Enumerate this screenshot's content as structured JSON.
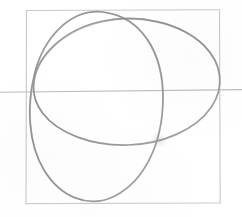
{
  "artwork": {
    "title": "pencil-sketch-overlapping-ellipses",
    "medium": "graphite pencil on white paper",
    "background_color": "#ffffff",
    "canvas": {
      "width": 242,
      "height": 217
    }
  },
  "palette": {
    "frame_stroke": "#c9c9c9",
    "axis_stroke": "#bdbdbd",
    "pencil_stroke": "#8f8f8f",
    "pencil_stroke_dark": "#7e7e7e",
    "pencil_stroke_light": "#a8a8a8",
    "smudge": "#d9d9d9"
  },
  "elements": {
    "frame": {
      "name": "rectangular-border-frame",
      "x": 25,
      "y": 10,
      "width": 195,
      "height": 193,
      "stroke_width": 1,
      "color": "#c9c9c9"
    },
    "horizontal_axis": {
      "name": "horizontal-guide-line",
      "x1": 0,
      "y1": 92,
      "x2": 242,
      "y2": 90,
      "stroke_width": 1,
      "color": "#bdbdbd",
      "note": "extends past frame on both left and right edges"
    },
    "ellipse_tilted": {
      "name": "large-tilted-ellipse",
      "center_x": 123,
      "center_y": 82,
      "radius_x": 99,
      "radius_y": 69,
      "rotation_deg": -12,
      "stroke_width": 1.7,
      "color": "#8f8f8f"
    },
    "ellipse_vertical": {
      "name": "vertical-oval",
      "center_x": 96,
      "center_y": 105,
      "radius_x": 66,
      "radius_y": 95,
      "rotation_deg": 4,
      "stroke_width": 1.7,
      "color": "#8f8f8f"
    },
    "smudge": {
      "name": "eraser-smudge-mark",
      "center_x": 159,
      "center_y": 140,
      "radius": 9,
      "color": "#d9d9d9"
    }
  },
  "shape_count": {
    "ellipses": 2,
    "guide_lines": 1,
    "frames": 1
  }
}
